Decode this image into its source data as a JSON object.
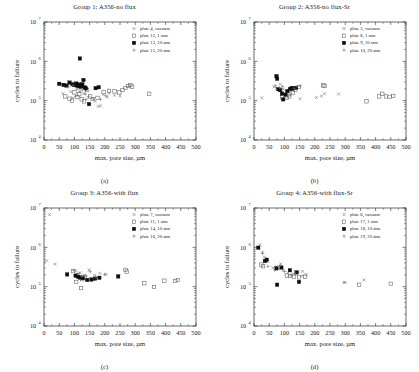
{
  "figure": {
    "xlabel": "max. pore size, µm",
    "ylabel": "cycles to failure",
    "xticks": [
      0,
      50,
      100,
      150,
      200,
      250,
      300,
      350,
      400,
      450,
      500
    ],
    "xlim": [
      0,
      500
    ],
    "ylim": [
      10000,
      10000000
    ],
    "yticks": [
      "10",
      "10",
      "10",
      "10"
    ],
    "yexp": [
      "4",
      "5",
      "6",
      "7"
    ],
    "grid": false,
    "legend_position": "top-right"
  },
  "chart_data": [
    {
      "type": "scatter",
      "panel": "a",
      "caption": "(a)",
      "title": "Group 1: A356-no flux",
      "xlabel": "max. pore size, µm",
      "ylabel": "cycles to failure",
      "xlim": [
        0,
        500
      ],
      "ylim": [
        10000,
        10000000
      ],
      "yscale": "log",
      "series": [
        {
          "name": "plate 4, vacuum",
          "marker": "cross",
          "points": [
            [
              62,
              150000
            ],
            [
              88,
              168000
            ],
            [
              96,
              118000
            ],
            [
              104,
              132000
            ],
            [
              118,
              205000
            ],
            [
              131,
              152000
            ],
            [
              140,
              110000
            ],
            [
              150,
              78000
            ],
            [
              168,
              96000
            ],
            [
              178,
              72000
            ],
            [
              186,
              74000
            ],
            [
              196,
              142000
            ],
            [
              208,
              123000
            ],
            [
              214,
              155000
            ],
            [
              232,
              138000
            ],
            [
              250,
              132000
            ]
          ]
        },
        {
          "name": "plate 12, 1 atm",
          "marker": "open-square",
          "points": [
            [
              70,
              128000
            ],
            [
              84,
              112000
            ],
            [
              92,
              100000
            ],
            [
              100,
              162000
            ],
            [
              110,
              123000
            ],
            [
              116,
              145000
            ],
            [
              124,
              108000
            ],
            [
              132,
              96000
            ],
            [
              142,
              188000
            ],
            [
              152,
              128000
            ],
            [
              160,
              110000
            ],
            [
              176,
              118000
            ],
            [
              196,
              165000
            ],
            [
              214,
              178000
            ],
            [
              232,
              172000
            ],
            [
              248,
              162000
            ],
            [
              258,
              186000
            ],
            [
              268,
              210000
            ],
            [
              276,
              235000
            ],
            [
              284,
              248000
            ],
            [
              290,
              228000
            ],
            [
              346,
              150000
            ]
          ]
        },
        {
          "name": "plate 13, 10 atm",
          "marker": "filled-square",
          "points": [
            [
              50,
              268000
            ],
            [
              64,
              252000
            ],
            [
              74,
              242000
            ],
            [
              84,
              288000
            ],
            [
              94,
              262000
            ],
            [
              100,
              248000
            ],
            [
              106,
              272000
            ],
            [
              110,
              238000
            ],
            [
              114,
              258000
            ],
            [
              116,
              232000
            ],
            [
              118,
              1180000
            ],
            [
              120,
              245000
            ],
            [
              122,
              228000
            ],
            [
              126,
              262000
            ],
            [
              130,
              335000
            ],
            [
              134,
              218000
            ],
            [
              138,
              205000
            ],
            [
              148,
              82000
            ],
            [
              170,
              208000
            ],
            [
              180,
              220000
            ]
          ]
        },
        {
          "name": "plate 15, 20 atm",
          "marker": "plus",
          "points": [
            [
              80,
              225000
            ],
            [
              96,
              245000
            ],
            [
              108,
              196000
            ],
            [
              118,
              172000
            ],
            [
              126,
              188000
            ],
            [
              136,
              148000
            ],
            [
              146,
              128000
            ],
            [
              162,
              112000
            ],
            [
              186,
              108000
            ],
            [
              204,
              132000
            ]
          ]
        }
      ]
    },
    {
      "type": "scatter",
      "panel": "b",
      "caption": "(b)",
      "title": "Group 2: A356-no flux-Sr",
      "xlabel": "max. pore size, µm",
      "ylabel": "cycles to failure",
      "xlim": [
        0,
        500
      ],
      "ylim": [
        10000,
        10000000
      ],
      "yscale": "log",
      "series": [
        {
          "name": "plate 3, vacuum",
          "marker": "cross",
          "points": [
            [
              26,
              118000
            ],
            [
              66,
              226000
            ],
            [
              74,
              205000
            ],
            [
              86,
              262000
            ],
            [
              96,
              196000
            ],
            [
              106,
              178000
            ],
            [
              118,
              162000
            ],
            [
              128,
              186000
            ],
            [
              140,
              205000
            ],
            [
              152,
              112000
            ],
            [
              205,
              120000
            ],
            [
              222,
              130000
            ],
            [
              232,
              150000
            ],
            [
              278,
              148000
            ]
          ]
        },
        {
          "name": "plate 8, 1 atm",
          "marker": "open-square",
          "points": [
            [
              92,
              122000
            ],
            [
              108,
              118000
            ],
            [
              116,
              128000
            ],
            [
              128,
              160000
            ],
            [
              136,
              190000
            ],
            [
              148,
              222000
            ],
            [
              228,
              245000
            ],
            [
              232,
              235000
            ],
            [
              370,
              96000
            ],
            [
              412,
              128000
            ],
            [
              422,
              150000
            ],
            [
              434,
              128000
            ],
            [
              446,
              125000
            ],
            [
              458,
              132000
            ]
          ]
        },
        {
          "name": "plate 9, 10 atm",
          "marker": "filled-square",
          "points": [
            [
              74,
              420000
            ],
            [
              76,
              360000
            ],
            [
              80,
              196000
            ],
            [
              86,
              185000
            ],
            [
              92,
              152000
            ],
            [
              96,
              108000
            ],
            [
              104,
              142000
            ],
            [
              110,
              175000
            ],
            [
              118,
              198000
            ],
            [
              124,
              210000
            ],
            [
              128,
              205000
            ],
            [
              138,
              212000
            ]
          ]
        },
        {
          "name": "plate 10, 20 atm",
          "marker": "plus",
          "points": [
            [
              70,
              240000
            ],
            [
              84,
              212000
            ],
            [
              94,
              228000
            ],
            [
              112,
              132000
            ],
            [
              120,
              138000
            ],
            [
              132,
              205000
            ],
            [
              142,
              228000
            ],
            [
              152,
              238000
            ]
          ]
        }
      ]
    },
    {
      "type": "scatter",
      "panel": "c",
      "caption": "(c)",
      "title": "Group 3: A356-with flux",
      "xlabel": "max. pore size, µm",
      "ylabel": "cycles to failure",
      "xlim": [
        0,
        500
      ],
      "ylim": [
        10000,
        10000000
      ],
      "yscale": "log",
      "series": [
        {
          "name": "plate 7, vacuum",
          "marker": "cross",
          "points": [
            [
              18,
              6800000
            ],
            [
              8,
              455000
            ],
            [
              36,
              372000
            ],
            [
              104,
              252000
            ],
            [
              118,
              225000
            ],
            [
              132,
              198000
            ],
            [
              148,
              265000
            ],
            [
              166,
              196000
            ],
            [
              184,
              218000
            ],
            [
              204,
              205000
            ],
            [
              246,
              190000
            ]
          ]
        },
        {
          "name": "plate 11, 1 atm",
          "marker": "open-square",
          "points": [
            [
              96,
              248000
            ],
            [
              106,
              132000
            ],
            [
              110,
              196000
            ],
            [
              118,
              168000
            ],
            [
              122,
              92000
            ],
            [
              126,
              155000
            ],
            [
              134,
              172000
            ],
            [
              268,
              268000
            ],
            [
              272,
              242000
            ],
            [
              330,
              122000
            ],
            [
              362,
              98000
            ],
            [
              396,
              142000
            ],
            [
              432,
              140000
            ],
            [
              440,
              148000
            ]
          ]
        },
        {
          "name": "plate 14, 10 atm",
          "marker": "filled-square",
          "points": [
            [
              76,
              205000
            ],
            [
              104,
              190000
            ],
            [
              112,
              178000
            ],
            [
              120,
              172000
            ],
            [
              128,
              165000
            ],
            [
              142,
              148000
            ],
            [
              156,
              152000
            ],
            [
              168,
              160000
            ],
            [
              182,
              168000
            ],
            [
              244,
              182000
            ]
          ]
        },
        {
          "name": "plate 16, 20 atm",
          "marker": "plus",
          "points": [
            [
              98,
              262000
            ],
            [
              112,
              215000
            ],
            [
              124,
              182000
            ],
            [
              138,
              190000
            ],
            [
              152,
              240000
            ],
            [
              170,
              175000
            ],
            [
              200,
              205000
            ]
          ]
        }
      ]
    },
    {
      "type": "scatter",
      "panel": "d",
      "caption": "(d)",
      "title": "Group 4: A356-with flux-Sr",
      "xlabel": "max. pore size, µm",
      "ylabel": "cycles to failure",
      "xlim": [
        0,
        500
      ],
      "ylim": [
        10000,
        10000000
      ],
      "yscale": "log",
      "series": [
        {
          "name": "plate 6, vacuum",
          "marker": "cross",
          "points": [
            [
              20,
              1150000
            ],
            [
              28,
              760000
            ],
            [
              34,
              560000
            ],
            [
              44,
              430000
            ],
            [
              62,
              300000
            ],
            [
              74,
              325000
            ],
            [
              88,
              380000
            ],
            [
              96,
              262000
            ],
            [
              112,
              225000
            ],
            [
              128,
              212000
            ],
            [
              146,
              238000
            ],
            [
              160,
              245000
            ],
            [
              172,
              205000
            ],
            [
              300,
              128000
            ],
            [
              362,
              148000
            ]
          ]
        },
        {
          "name": "plate 17, 1 atm",
          "marker": "open-square",
          "points": [
            [
              24,
              365000
            ],
            [
              30,
              330000
            ],
            [
              108,
              192000
            ],
            [
              118,
              186000
            ],
            [
              132,
              178000
            ],
            [
              148,
              172000
            ],
            [
              168,
              180000
            ],
            [
              346,
              112000
            ],
            [
              450,
              118000
            ]
          ]
        },
        {
          "name": "plate 18, 10 atm",
          "marker": "filled-square",
          "points": [
            [
              14,
              980000
            ],
            [
              36,
              450000
            ],
            [
              42,
              485000
            ],
            [
              74,
              292000
            ],
            [
              76,
              112000
            ],
            [
              90,
              305000
            ],
            [
              118,
              262000
            ],
            [
              140,
              230000
            ],
            [
              148,
              132000
            ]
          ]
        },
        {
          "name": "plate 19, 20 atm",
          "marker": "plus",
          "points": [
            [
              28,
              700000
            ],
            [
              46,
              330000
            ],
            [
              68,
              265000
            ],
            [
              86,
              345000
            ],
            [
              100,
              242000
            ],
            [
              122,
              196000
            ],
            [
              136,
              222000
            ],
            [
              158,
              188000
            ],
            [
              296,
              128000
            ]
          ]
        }
      ]
    }
  ]
}
